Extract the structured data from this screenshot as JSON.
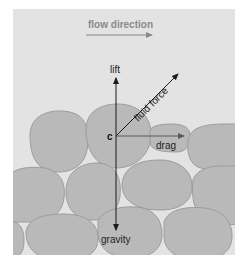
{
  "diagram": {
    "flow_label": "flow direction",
    "center_label": "c",
    "forces": {
      "lift": "lift",
      "fluid_force": "fluid force",
      "drag": "drag",
      "gravity": "gravity"
    },
    "colors": {
      "background": "#e3e3e3",
      "grain_fill": "#b9b9b9",
      "grain_stroke": "#9c9c9c",
      "flow_arrow": "#8a8a8a",
      "force_arrow": "#1a1a1a",
      "drag_arrow": "#6e6e6e"
    }
  }
}
